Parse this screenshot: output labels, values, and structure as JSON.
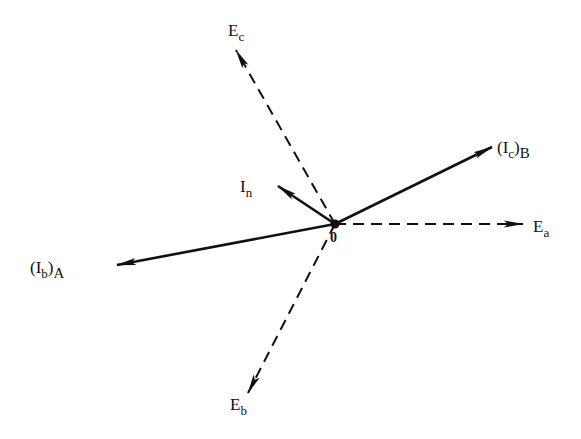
{
  "diagram": {
    "type": "phasor-diagram",
    "origin": {
      "x": 335,
      "y": 224,
      "label": "0"
    },
    "color": "#111111",
    "phasors": [
      {
        "id": "Ea",
        "main": "E",
        "sub": "a",
        "style": "dashed",
        "tip": {
          "x": 523,
          "y": 224
        },
        "label_pos": {
          "x": 533,
          "y": 232
        }
      },
      {
        "id": "Eb",
        "main": "E",
        "sub": "b",
        "style": "dashed",
        "tip": {
          "x": 248,
          "y": 393
        },
        "label_pos": {
          "x": 230,
          "y": 410
        }
      },
      {
        "id": "Ec",
        "main": "E",
        "sub": "c",
        "style": "dashed",
        "tip": {
          "x": 236,
          "y": 50
        },
        "label_pos": {
          "x": 228,
          "y": 36
        }
      },
      {
        "id": "IcB",
        "main": "(I",
        "sub": "c",
        "close": ")",
        "sub2": "B",
        "style": "solid",
        "tip": {
          "x": 492,
          "y": 147
        },
        "label_pos": {
          "x": 497,
          "y": 153
        }
      },
      {
        "id": "IbA",
        "main": "(I",
        "sub": "b",
        "close": ")",
        "sub2": "A",
        "style": "solid",
        "tip": {
          "x": 117,
          "y": 265
        },
        "label_pos": {
          "x": 30,
          "y": 273
        }
      },
      {
        "id": "In",
        "main": "I",
        "sub": "n",
        "style": "solid",
        "tip": {
          "x": 278,
          "y": 186
        },
        "label_pos": {
          "x": 240,
          "y": 192
        }
      }
    ]
  }
}
